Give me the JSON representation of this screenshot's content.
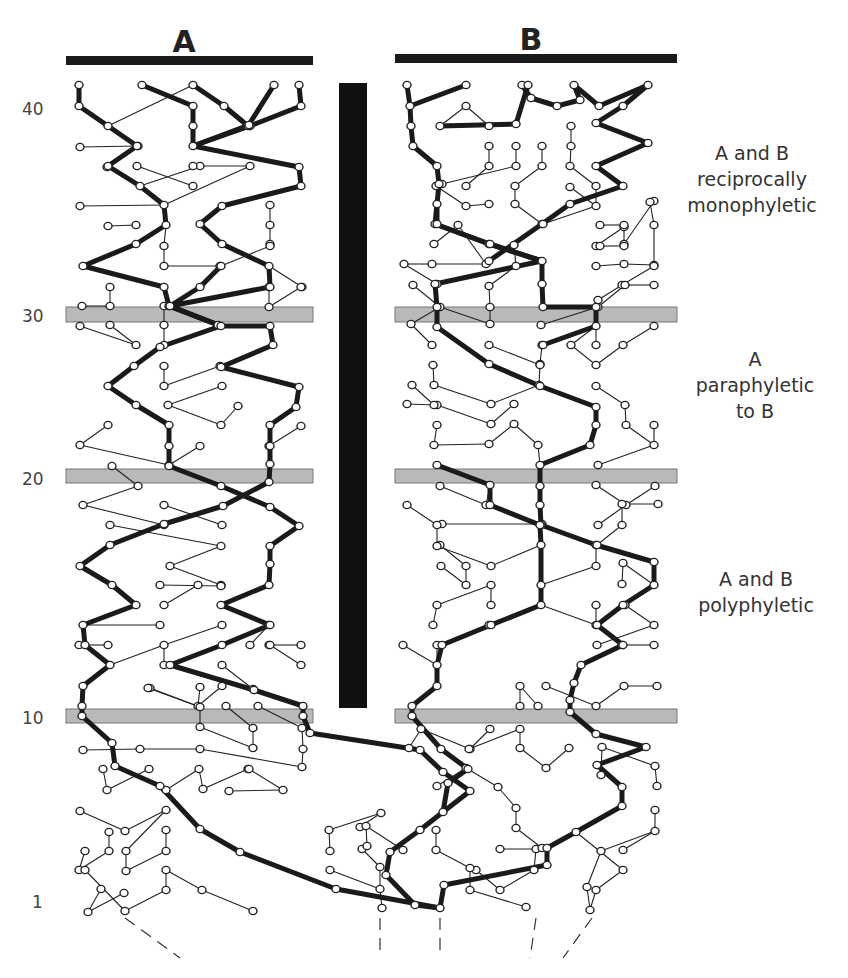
{
  "populations": [
    {
      "label": "A",
      "bar": {
        "x1": 66,
        "x2": 313,
        "y": 61
      },
      "label_x": 184,
      "label_y": 52
    },
    {
      "label": "B",
      "bar": {
        "x1": 395,
        "x2": 677,
        "y": 59
      },
      "label_x": 531,
      "label_y": 50
    }
  ],
  "barrier": {
    "x": 339,
    "y": 83,
    "width": 28,
    "height": 625,
    "color": "#111111"
  },
  "generation_labels": [
    {
      "text": "40",
      "y": 115
    },
    {
      "text": "30",
      "y": 322
    },
    {
      "text": "20",
      "y": 485
    },
    {
      "text": "10",
      "y": 724
    },
    {
      "text": "1",
      "y": 908
    }
  ],
  "bands": [
    {
      "generation": 30,
      "y": 307,
      "height": 15
    },
    {
      "generation": 20,
      "y": 469,
      "height": 14
    },
    {
      "generation": 10,
      "y": 709,
      "height": 14
    }
  ],
  "phase_labels": [
    {
      "lines": [
        "A and B",
        "reciprocally",
        "monophyletic"
      ],
      "x": 752,
      "y": 160
    },
    {
      "lines": [
        "A",
        "paraphyletic",
        "to B"
      ],
      "x": 755,
      "y": 366
    },
    {
      "lines": [
        "A and B",
        "polyphyletic"
      ],
      "x": 756,
      "y": 586
    }
  ],
  "colors": {
    "band": "#b9b9b9",
    "ink": "#1a1a1a",
    "background": "#ffffff"
  },
  "lineage_paths_thick": [
    "79,85 79,106 108,126 137,146 108,166 140,186 164,205 166,225 136,244 83,266 164,287 169,306 221,326 270,326 273,345 221,367 299,387 296,407 270,425 270,446 270,464 269,482 223,506 164,524 110,545 80,566 112,585 136,605 83,625 85,645 110,665 83,686 82,706 82,716 112,743 115,766 160,786",
    "142,85 193,106 193,126 193,146 250,126 301,106 299,85",
    "193,85 224,106 248,126 274,85",
    "193,146 299,167 301,186 222,206 200,224 222,244 269,266 270,287 170,306 200,287 221,266",
    "193,146 249,125",
    "169,306 221,326",
    "170,306 221,326 160,347 134,366 108,386 136,405 169,425 169,446 169,466 221,486 270,507 299,526 270,546 270,564 269,585 221,605 270,625 222,645 170,665 254,690 303,706 303,716 310,733 420,750 443,772 470,791 443,812 420,830 390,852 386,875 415,905 440,908",
    "160,786 200,829 240,852 336,889 440,908",
    "407,85 410,106 411,126 413,146 437,166 439,184 437,204 435,224 489,244 542,261 542,284 543,307 596,307 596,326 543,345",
    "410,106 466,85",
    "522,85 531,98 557,106 580,100 574,85 599,106",
    "599,106 648,85 623,106 596,123 648,143 596,166 623,186 570,204 542,224 489,261",
    "440,126 516,124 528,85",
    "437,204 437,224",
    "435,224 490,244 542,261",
    "542,261 435,284 437,307 437,327 489,364 540,386 596,407 596,425 590,445 540,465 540,486 540,505 541,525 596,545 654,562 654,585 623,605 597,625 623,645 581,665 574,683 570,700 570,712 596,734 646,747 597,765 622,787 622,806 576,832 547,848 547,865 444,885 440,908",
    "437,465 490,485 490,505 540,525 541,545 541,605 491,625 442,645 437,665 437,686 412,706 412,716 441,749 468,769 448,783 443,812"
  ],
  "thin_links": [
    [
      108,
      126,
      193,
      85
    ],
    [
      138,
      146,
      80,
      147
    ],
    [
      107,
      167,
      140,
      186
    ],
    [
      137,
      166,
      193,
      186
    ],
    [
      164,
      205,
      80,
      206
    ],
    [
      140,
      186,
      200,
      166
    ],
    [
      193,
      166,
      250,
      166
    ],
    [
      164,
      205,
      250,
      166
    ],
    [
      136,
      225,
      108,
      226
    ],
    [
      166,
      225,
      164,
      246
    ],
    [
      164,
      266,
      220,
      266
    ],
    [
      164,
      266,
      164,
      246
    ],
    [
      270,
      205,
      270,
      225
    ],
    [
      270,
      244,
      270,
      225
    ],
    [
      269,
      266,
      302,
      287
    ],
    [
      221,
      266,
      270,
      246
    ],
    [
      82,
      306,
      110,
      306
    ],
    [
      110,
      306,
      110,
      287
    ],
    [
      80,
      326,
      136,
      345
    ],
    [
      136,
      345,
      110,
      325
    ],
    [
      164,
      345,
      218,
      325
    ],
    [
      164,
      345,
      164,
      325
    ],
    [
      164,
      325,
      164,
      306
    ],
    [
      269,
      307,
      269,
      287
    ],
    [
      269,
      307,
      301,
      287
    ],
    [
      164,
      386,
      164,
      366
    ],
    [
      164,
      386,
      220,
      366
    ],
    [
      168,
      405,
      222,
      386
    ],
    [
      221,
      425,
      238,
      406
    ],
    [
      221,
      425,
      168,
      405
    ],
    [
      108,
      425,
      80,
      445
    ],
    [
      80,
      445,
      169,
      465
    ],
    [
      169,
      465,
      200,
      446
    ],
    [
      269,
      446,
      301,
      426
    ],
    [
      112,
      466,
      138,
      486
    ],
    [
      138,
      486,
      83,
      505
    ],
    [
      83,
      505,
      164,
      525
    ],
    [
      164,
      505,
      222,
      525
    ],
    [
      110,
      525,
      221,
      546
    ],
    [
      221,
      546,
      170,
      566
    ],
    [
      170,
      566,
      221,
      585
    ],
    [
      160,
      585,
      221,
      586
    ],
    [
      164,
      605,
      198,
      585
    ],
    [
      160,
      625,
      83,
      625
    ],
    [
      108,
      645,
      79,
      645
    ],
    [
      110,
      665,
      164,
      645
    ],
    [
      164,
      665,
      164,
      645
    ],
    [
      164,
      645,
      222,
      625
    ],
    [
      250,
      645,
      269,
      625
    ],
    [
      269,
      645,
      301,
      645
    ],
    [
      301,
      665,
      270,
      645
    ],
    [
      222,
      665,
      253,
      689
    ],
    [
      222,
      686,
      198,
      706
    ],
    [
      150,
      688,
      200,
      707
    ],
    [
      200,
      707,
      200,
      727
    ],
    [
      200,
      727,
      253,
      748
    ],
    [
      253,
      748,
      253,
      728
    ],
    [
      253,
      728,
      226,
      706
    ],
    [
      198,
      706,
      200,
      687
    ],
    [
      200,
      707,
      148,
      688
    ],
    [
      83,
      750,
      140,
      749
    ],
    [
      140,
      749,
      200,
      749
    ],
    [
      200,
      749,
      302,
      767
    ],
    [
      302,
      767,
      303,
      749
    ],
    [
      303,
      749,
      302,
      728
    ],
    [
      302,
      728,
      258,
      706
    ],
    [
      103,
      769,
      107,
      790
    ],
    [
      107,
      790,
      149,
      769
    ],
    [
      166,
      790,
      199,
      769
    ],
    [
      199,
      769,
      203,
      789
    ],
    [
      203,
      789,
      248,
      769
    ],
    [
      249,
      769,
      283,
      790
    ],
    [
      283,
      790,
      229,
      791
    ],
    [
      80,
      811,
      125,
      831
    ],
    [
      125,
      831,
      166,
      810
    ],
    [
      166,
      810,
      126,
      851
    ],
    [
      126,
      851,
      126,
      871
    ],
    [
      126,
      871,
      166,
      851
    ],
    [
      166,
      851,
      166,
      830
    ],
    [
      109,
      832,
      109,
      851
    ],
    [
      109,
      851,
      79,
      870
    ],
    [
      79,
      870,
      85,
      851
    ],
    [
      85,
      870,
      125,
      911
    ],
    [
      125,
      911,
      166,
      890
    ],
    [
      166,
      890,
      166,
      870
    ],
    [
      166,
      870,
      202,
      890
    ],
    [
      202,
      890,
      253,
      911
    ],
    [
      101,
      889,
      88,
      912
    ],
    [
      88,
      912,
      124,
      893
    ],
    [
      382,
      908,
      380,
      889
    ],
    [
      380,
      889,
      330,
      870
    ],
    [
      380,
      889,
      380,
      867
    ],
    [
      380,
      867,
      362,
      849
    ],
    [
      360,
      827,
      381,
      813
    ],
    [
      381,
      813,
      329,
      830
    ],
    [
      329,
      830,
      330,
      851
    ],
    [
      403,
      850,
      366,
      826
    ],
    [
      366,
      826,
      367,
      846
    ],
    [
      500,
      849,
      536,
      849
    ],
    [
      536,
      849,
      534,
      870
    ],
    [
      534,
      870,
      500,
      890
    ],
    [
      500,
      890,
      476,
      870
    ],
    [
      526,
      907,
      470,
      890
    ],
    [
      470,
      890,
      470,
      868
    ],
    [
      470,
      868,
      436,
      850
    ],
    [
      436,
      850,
      436,
      830
    ],
    [
      576,
      832,
      623,
      870
    ],
    [
      623,
      870,
      596,
      890
    ],
    [
      596,
      890,
      590,
      910
    ],
    [
      590,
      910,
      587,
      887
    ],
    [
      623,
      850,
      655,
      831
    ],
    [
      655,
      831,
      655,
      810
    ],
    [
      655,
      831,
      601,
      851
    ],
    [
      601,
      851,
      587,
      887
    ],
    [
      601,
      775,
      602,
      747
    ],
    [
      602,
      747,
      655,
      766
    ],
    [
      655,
      766,
      657,
      786
    ],
    [
      490,
      729,
      470,
      749
    ],
    [
      470,
      749,
      421,
      729
    ],
    [
      421,
      729,
      409,
      748
    ],
    [
      469,
      749,
      520,
      729
    ],
    [
      520,
      729,
      520,
      748
    ],
    [
      520,
      748,
      546,
      768
    ],
    [
      546,
      768,
      569,
      748
    ],
    [
      437,
      786,
      466,
      768
    ],
    [
      466,
      768,
      498,
      787
    ],
    [
      498,
      787,
      516,
      808
    ],
    [
      516,
      808,
      516,
      828
    ],
    [
      516,
      828,
      542,
      848
    ],
    [
      520,
      706,
      520,
      686
    ],
    [
      520,
      686,
      538,
      706
    ],
    [
      546,
      686,
      596,
      706
    ],
    [
      596,
      706,
      624,
      686
    ],
    [
      624,
      686,
      657,
      686
    ],
    [
      403,
      645,
      437,
      665
    ],
    [
      437,
      665,
      437,
      645
    ],
    [
      433,
      625,
      437,
      605
    ],
    [
      437,
      605,
      491,
      585
    ],
    [
      491,
      585,
      491,
      605
    ],
    [
      441,
      566,
      466,
      585
    ],
    [
      466,
      585,
      466,
      566
    ],
    [
      466,
      566,
      440,
      545
    ],
    [
      442,
      524,
      542,
      524
    ],
    [
      542,
      524,
      540,
      505
    ],
    [
      407,
      505,
      437,
      525
    ],
    [
      437,
      525,
      437,
      546
    ],
    [
      437,
      546,
      491,
      566
    ],
    [
      491,
      566,
      541,
      545
    ],
    [
      541,
      605,
      489,
      625
    ],
    [
      541,
      605,
      596,
      625
    ],
    [
      596,
      625,
      596,
      605
    ],
    [
      541,
      585,
      596,
      566
    ],
    [
      596,
      566,
      596,
      545
    ],
    [
      622,
      584,
      623,
      563
    ],
    [
      623,
      563,
      654,
      585
    ],
    [
      625,
      605,
      654,
      625
    ],
    [
      597,
      645,
      654,
      625
    ],
    [
      622,
      645,
      654,
      645
    ],
    [
      437,
      405,
      407,
      404
    ],
    [
      437,
      405,
      491,
      424
    ],
    [
      491,
      424,
      514,
      404
    ],
    [
      437,
      425,
      434,
      445
    ],
    [
      434,
      445,
      489,
      444
    ],
    [
      489,
      444,
      514,
      424
    ],
    [
      514,
      424,
      538,
      445
    ],
    [
      538,
      445,
      540,
      465
    ],
    [
      412,
      385,
      434,
      405
    ],
    [
      433,
      365,
      434,
      385
    ],
    [
      434,
      385,
      491,
      404
    ],
    [
      491,
      404,
      539,
      385
    ],
    [
      539,
      385,
      540,
      364
    ],
    [
      540,
      364,
      542,
      345
    ],
    [
      489,
      345,
      540,
      365
    ],
    [
      541,
      325,
      598,
      307
    ],
    [
      571,
      345,
      596,
      326
    ],
    [
      596,
      326,
      596,
      345
    ],
    [
      571,
      345,
      596,
      365
    ],
    [
      596,
      365,
      623,
      345
    ],
    [
      623,
      345,
      654,
      326
    ],
    [
      596,
      386,
      625,
      405
    ],
    [
      625,
      405,
      626,
      425
    ],
    [
      626,
      425,
      654,
      445
    ],
    [
      598,
      465,
      654,
      445
    ],
    [
      654,
      445,
      654,
      425
    ],
    [
      596,
      485,
      626,
      505
    ],
    [
      626,
      505,
      655,
      486
    ],
    [
      626,
      505,
      598,
      525
    ],
    [
      440,
      486,
      486,
      505
    ],
    [
      486,
      505,
      490,
      485
    ],
    [
      597,
      545,
      622,
      525
    ],
    [
      622,
      525,
      622,
      504
    ],
    [
      622,
      504,
      658,
      504
    ],
    [
      432,
      345,
      411,
      324
    ],
    [
      411,
      324,
      440,
      307
    ],
    [
      440,
      307,
      413,
      285
    ],
    [
      490,
      324,
      440,
      307
    ],
    [
      490,
      324,
      490,
      307
    ],
    [
      490,
      307,
      489,
      286
    ],
    [
      489,
      286,
      516,
      266
    ],
    [
      516,
      266,
      514,
      245
    ],
    [
      514,
      245,
      542,
      224
    ],
    [
      542,
      224,
      515,
      204
    ],
    [
      515,
      204,
      515,
      186
    ],
    [
      515,
      186,
      542,
      166
    ],
    [
      542,
      166,
      542,
      146
    ],
    [
      489,
      204,
      466,
      206
    ],
    [
      466,
      206,
      436,
      186
    ],
    [
      466,
      186,
      489,
      166
    ],
    [
      489,
      166,
      489,
      146
    ],
    [
      434,
      244,
      458,
      225
    ],
    [
      458,
      225,
      486,
      264
    ],
    [
      486,
      264,
      432,
      264
    ],
    [
      432,
      264,
      404,
      264
    ],
    [
      404,
      264,
      437,
      284
    ],
    [
      571,
      126,
      571,
      146
    ],
    [
      571,
      146,
      570,
      166
    ],
    [
      570,
      166,
      596,
      186
    ],
    [
      596,
      186,
      596,
      206
    ],
    [
      596,
      206,
      543,
      224
    ],
    [
      596,
      246,
      624,
      227
    ],
    [
      624,
      227,
      624,
      244
    ],
    [
      624,
      244,
      654,
      201
    ],
    [
      596,
      266,
      624,
      264
    ],
    [
      624,
      264,
      654,
      265
    ],
    [
      654,
      265,
      654,
      225
    ],
    [
      654,
      225,
      650,
      202
    ],
    [
      622,
      285,
      598,
      300
    ],
    [
      598,
      300,
      598,
      307
    ],
    [
      598,
      307,
      625,
      285
    ],
    [
      625,
      285,
      654,
      285
    ],
    [
      622,
      285,
      654,
      266
    ],
    [
      489,
      126,
      466,
      106
    ],
    [
      466,
      106,
      440,
      126
    ],
    [
      442,
      184,
      516,
      166
    ],
    [
      516,
      166,
      516,
      146
    ],
    [
      570,
      187,
      596,
      206
    ],
    [
      600,
      225,
      624,
      225
    ],
    [
      600,
      246,
      624,
      246
    ]
  ],
  "nodes_comment": "Nodes are drawn at every endpoint of thick paths and thin links.",
  "dashed_ancestry": [
    [
      125,
      918,
      180,
      958
    ],
    [
      380,
      918,
      380,
      958
    ],
    [
      440,
      918,
      440,
      958
    ],
    [
      536,
      918,
      530,
      958
    ],
    [
      592,
      918,
      563,
      958
    ]
  ]
}
